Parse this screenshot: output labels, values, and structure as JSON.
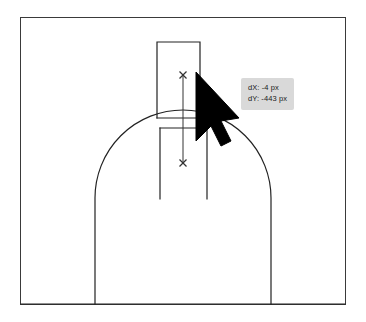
{
  "app": {
    "canvas_label": "drawing-canvas",
    "background_color": "#ffffff",
    "frame_border_color": "#3a3a3a",
    "stroke_color": "#222222"
  },
  "tooltip": {
    "name": "drag-delta-tooltip",
    "background_color": "#d9d9d9",
    "text_color": "#1a1a1a",
    "dx_line": "dX: -4 px",
    "dy_line": "dY: -443 px",
    "dx_value": -4,
    "dy_value": -443,
    "unit": "px"
  },
  "cursor": {
    "name": "arrow-pointer-cursor",
    "color": "#000000",
    "tip_x": 196,
    "tip_y": 72
  },
  "markers": [
    {
      "name": "drag-start-marker",
      "glyph": "x",
      "x": 183,
      "y": 75
    },
    {
      "name": "drag-end-marker",
      "glyph": "x",
      "x": 183,
      "y": 163
    }
  ],
  "geometry": {
    "frame": {
      "x": 20,
      "y": 17,
      "width": 326,
      "height": 288
    },
    "upper_rect": {
      "left": 157,
      "top": 42,
      "right": 200,
      "bottom": 118
    },
    "lower_rect": {
      "left": 160,
      "top": 128,
      "right": 207,
      "bottom": 198
    },
    "dome": {
      "center_x": 183,
      "center_y": 198,
      "radius": 88
    },
    "baseline_y": 304,
    "drag_line": {
      "x": 183,
      "from_y": 75,
      "to_y": 163
    }
  }
}
